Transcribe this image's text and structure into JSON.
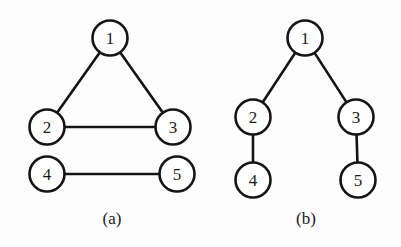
{
  "figure": {
    "background_color": "#fdfdfd",
    "stroke_color": "#141414",
    "node_fill_color": "#ffffff",
    "node_radius": 17.5,
    "stroke_width": 2.6,
    "panels": [
      {
        "id": "panel-a",
        "caption": "(a)",
        "caption_x": 112,
        "caption_y": 218,
        "type": "undirected-graph",
        "nodes": [
          {
            "id": "a1",
            "label": "1",
            "cx": 110,
            "cy": 38
          },
          {
            "id": "a2",
            "label": "2",
            "cx": 47,
            "cy": 127
          },
          {
            "id": "a3",
            "label": "3",
            "cx": 173,
            "cy": 127
          },
          {
            "id": "a4",
            "label": "4",
            "cx": 47,
            "cy": 174
          },
          {
            "id": "a5",
            "label": "5",
            "cx": 177,
            "cy": 174
          }
        ],
        "edges": [
          {
            "id": "a-edge-1-2",
            "from": "a1",
            "to": "a2"
          },
          {
            "id": "a-edge-1-3",
            "from": "a1",
            "to": "a3"
          },
          {
            "id": "a-edge-2-3",
            "from": "a2",
            "to": "a3"
          },
          {
            "id": "a-edge-4-5",
            "from": "a4",
            "to": "a5"
          }
        ]
      },
      {
        "id": "panel-b",
        "caption": "(b)",
        "caption_x": 306,
        "caption_y": 218,
        "type": "tree",
        "nodes": [
          {
            "id": "b1",
            "label": "1",
            "cx": 305,
            "cy": 38
          },
          {
            "id": "b2",
            "label": "2",
            "cx": 253,
            "cy": 117
          },
          {
            "id": "b3",
            "label": "3",
            "cx": 356,
            "cy": 117
          },
          {
            "id": "b4",
            "label": "4",
            "cx": 253,
            "cy": 180
          },
          {
            "id": "b5",
            "label": "5",
            "cx": 358,
            "cy": 180
          }
        ],
        "edges": [
          {
            "id": "b-edge-1-2",
            "from": "b1",
            "to": "b2"
          },
          {
            "id": "b-edge-1-3",
            "from": "b1",
            "to": "b3"
          },
          {
            "id": "b-edge-2-4",
            "from": "b2",
            "to": "b4"
          },
          {
            "id": "b-edge-3-5",
            "from": "b3",
            "to": "b5"
          }
        ]
      }
    ]
  }
}
